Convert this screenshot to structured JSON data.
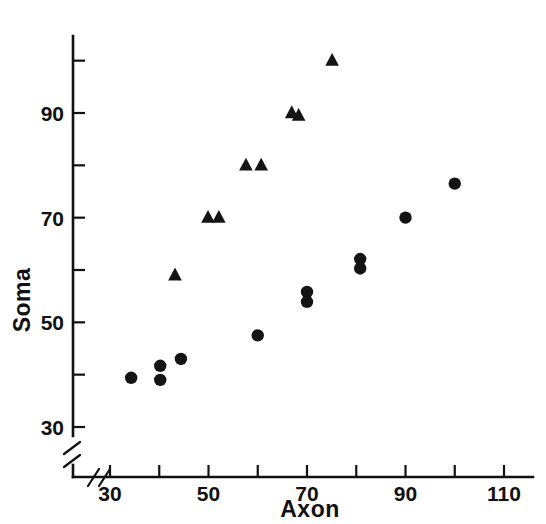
{
  "chart_data": {
    "type": "scatter",
    "title": "",
    "xlabel": "Axon",
    "ylabel": "Soma",
    "xlim": [
      26,
      114
    ],
    "ylim": [
      27,
      104
    ],
    "grid": false,
    "legend": "none",
    "axis_break_x": true,
    "axis_break_y": true,
    "xticks": [
      30,
      40,
      50,
      60,
      70,
      80,
      90,
      100,
      110
    ],
    "xticklabels": [
      "30",
      "",
      "50",
      "",
      "70",
      "",
      "90",
      "",
      "110"
    ],
    "yticks": [
      30,
      40,
      50,
      60,
      70,
      80,
      90,
      100
    ],
    "yticklabels": [
      "30",
      "",
      "50",
      "",
      "70",
      "",
      "90",
      ""
    ],
    "series": [
      {
        "name": "circles",
        "marker": "circle",
        "color": "#141414",
        "points": [
          {
            "x": 34.3,
            "y": 39.4
          },
          {
            "x": 40.2,
            "y": 41.7
          },
          {
            "x": 40.2,
            "y": 39.0
          },
          {
            "x": 44.4,
            "y": 43.0
          },
          {
            "x": 60.0,
            "y": 47.5
          },
          {
            "x": 70.0,
            "y": 55.8
          },
          {
            "x": 70.0,
            "y": 53.9
          },
          {
            "x": 80.8,
            "y": 62.1
          },
          {
            "x": 80.8,
            "y": 60.3
          },
          {
            "x": 90.0,
            "y": 70.0
          },
          {
            "x": 100.0,
            "y": 76.5
          }
        ]
      },
      {
        "name": "triangles",
        "marker": "triangle",
        "color": "#141414",
        "points": [
          {
            "x": 43.2,
            "y": 59.0
          },
          {
            "x": 49.9,
            "y": 70.0
          },
          {
            "x": 52.1,
            "y": 70.0
          },
          {
            "x": 57.6,
            "y": 80.0
          },
          {
            "x": 60.7,
            "y": 80.0
          },
          {
            "x": 66.9,
            "y": 90.0
          },
          {
            "x": 68.3,
            "y": 89.5
          },
          {
            "x": 75.1,
            "y": 100.0
          }
        ]
      }
    ]
  },
  "axes": {
    "x_title": "Axon",
    "y_title": "Soma"
  }
}
